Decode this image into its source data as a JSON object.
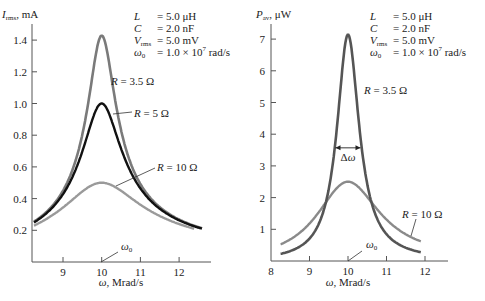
{
  "chart_data": [
    {
      "type": "line",
      "title": "",
      "ylabel": "I_rms, mA",
      "ylabel_main": "I",
      "ylabel_sub": "rms",
      "ylabel_unit": ", mA",
      "xlabel": "ω, Mrad/s",
      "xlim": [
        8.2,
        12.8
      ],
      "ylim": [
        0.0,
        1.5
      ],
      "x_ticks": [
        9,
        10,
        11,
        12
      ],
      "y_ticks": [
        0.2,
        0.4,
        0.6,
        0.8,
        1.0,
        1.2,
        1.4
      ],
      "y_tick_labels": [
        "0.2",
        "0.4",
        "0.6",
        "0.8",
        "1.0",
        "1.2",
        "1.4"
      ],
      "x_range_curve": [
        8.2,
        12.6
      ],
      "series": [
        {
          "name": "R = 3.5 Ω",
          "R": 3.5,
          "peak": 1.43,
          "color": "#7a7a7a",
          "width": 2.6
        },
        {
          "name": "R = 5 Ω",
          "R": 5,
          "peak": 1.0,
          "color": "#111111",
          "width": 2.4
        },
        {
          "name": "R = 10 Ω",
          "R": 10,
          "peak": 0.5,
          "color": "#9a9a9a",
          "width": 2.4
        }
      ],
      "annotations": [
        "R = 3.5 Ω",
        "R = 5 Ω",
        "R = 10 Ω",
        "ω0"
      ],
      "params": [
        "L = 5.0 μH",
        "C = 2.0 nF",
        "V_rms = 5.0 mV",
        "ω0 = 1.0 × 10^7 rad/s"
      ],
      "grid": false
    },
    {
      "type": "line",
      "title": "",
      "ylabel": "P_av, μW",
      "xlabel": "ω, Mrad/s",
      "xlim": [
        8,
        12.6
      ],
      "ylim": [
        0,
        7.4
      ],
      "x_ticks": [
        8,
        9,
        10,
        11,
        12
      ],
      "y_ticks": [
        1,
        2,
        3,
        4,
        5,
        6,
        7
      ],
      "x_range_curve": [
        8.25,
        11.9
      ],
      "series": [
        {
          "name": "R = 3.5 Ω",
          "R": 3.5,
          "peak": 7.14,
          "color": "#555555",
          "width": 2.6
        },
        {
          "name": "R = 10 Ω",
          "R": 10,
          "peak": 2.5,
          "color": "#8a8a8a",
          "width": 2.4
        }
      ],
      "annotations": [
        "R = 3.5 Ω",
        "R = 10 Ω",
        "Δω",
        "ω0"
      ],
      "grid": false
    }
  ],
  "left": {
    "ylabel_main": "I",
    "ylabel_sub": "rms",
    "ylabel_unit": ", mA",
    "xlabel": "ω, Mrad/s",
    "omega0": "ω",
    "omega0_sub": "0",
    "labels": {
      "r35": "R = 3.5 Ω",
      "r5": "R = 5 Ω",
      "r10": "R = 10 Ω"
    }
  },
  "right": {
    "ylabel_main": "P",
    "ylabel_sub": "av",
    "ylabel_unit": ", μW",
    "xlabel": "ω, Mrad/s",
    "omega0": "ω",
    "omega0_sub": "0",
    "delta": "Δω",
    "labels": {
      "r35": "R = 3.5 Ω",
      "r10": "R = 10 Ω"
    }
  },
  "params": {
    "L_sym": "L",
    "L_val": "= 5.0 μH",
    "C_sym": "C",
    "C_val": "= 2.0 nF",
    "V_sym": "V",
    "V_sub": "rms",
    "V_val": "= 5.0 mV",
    "w_sym": "ω",
    "w_sub": "0",
    "w_val": "=  1.0 × 10",
    "w_exp": "7",
    "w_unit": " rad/s"
  },
  "physics": {
    "V_mV": 5.0,
    "L_uH": 5.0,
    "omega0_Mrad": 10.0
  }
}
